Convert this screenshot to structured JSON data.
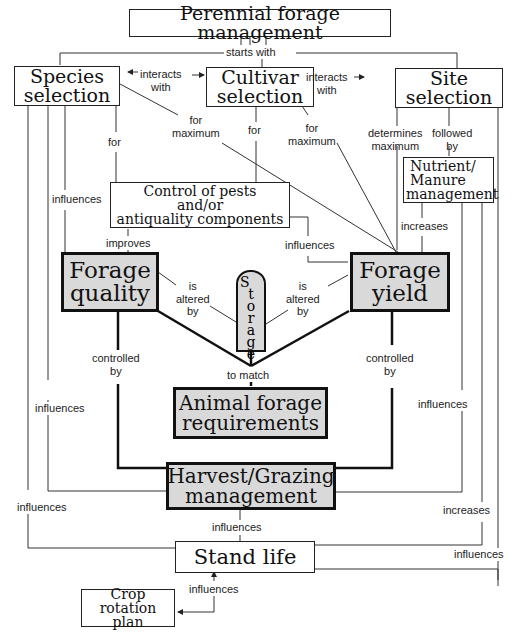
{
  "diagram": {
    "title": "Perennial forage management",
    "nodes": {
      "species": {
        "line1": "Species",
        "line2": "selection"
      },
      "cultivar": {
        "line1": "Cultivar",
        "line2": "selection"
      },
      "site": {
        "line1": "Site",
        "line2": "selection"
      },
      "nutrient": {
        "line1": "Nutrient/",
        "line2": "Manure",
        "line3": "management"
      },
      "pests": {
        "line1": "Control of pests",
        "line2": "and/or",
        "line3": "antiquality components"
      },
      "quality": {
        "line1": "Forage",
        "line2": "quality"
      },
      "yield": {
        "line1": "Forage",
        "line2": "yield"
      },
      "storage": {
        "letters": [
          "S",
          "t",
          "o",
          "r",
          "a",
          "g",
          "e"
        ]
      },
      "animal": {
        "line1": "Animal forage",
        "line2": "requirements"
      },
      "harvest": {
        "line1": "Harvest/Grazing",
        "line2": "management"
      },
      "stand": {
        "line1": "Stand life"
      },
      "crop": {
        "line1": "Crop rotation",
        "line2": "plan"
      }
    },
    "edge_labels": {
      "starts_with": "starts with",
      "interacts_with_1a": "interacts",
      "interacts_with_1b": "with",
      "interacts_with_2a": "interacts",
      "interacts_with_2b": "with",
      "species_for_max_a": "for",
      "species_for_max_b": "maximum",
      "cultivar_for_max_a": "for",
      "cultivar_for_max_b": "maximum",
      "cultivar_for": "for",
      "species_for": "for",
      "site_determines_a": "determines",
      "site_determines_b": "maximum",
      "site_followed_a": "followed",
      "site_followed_b": "by",
      "species_influences": "influences",
      "improves": "improves",
      "pests_influences": "influences",
      "nutrient_increases": "increases",
      "quality_altered_a": "is",
      "quality_altered_b": "altered",
      "quality_altered_c": "by",
      "yield_altered_a": "is",
      "yield_altered_b": "altered",
      "yield_altered_c": "by",
      "quality_controlled_a": "controlled",
      "quality_controlled_b": "by",
      "yield_controlled_a": "controlled",
      "yield_controlled_b": "by",
      "to_match": "to match",
      "left_influences_1": "influences",
      "left_influences_2": "influences",
      "right_influences_1": "influences",
      "harvest_influences": "influences",
      "right_increases": "increases",
      "right_influences_2": "influences",
      "stand_influences": "influences"
    }
  }
}
